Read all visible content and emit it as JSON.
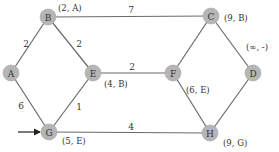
{
  "diagram": {
    "type": "weighted-graph-shortest-path",
    "start_node": "G",
    "colors": {
      "node_fill": "#b5b5b5",
      "edge": "#6a6a6a",
      "text": "#333333"
    },
    "nodes": [
      {
        "id": "A",
        "label": "A",
        "x": 11,
        "y": 73,
        "annotation": ""
      },
      {
        "id": "B",
        "label": "B",
        "x": 48,
        "y": 17,
        "annotation": "(2, A)",
        "ann_x": 58,
        "ann_y": 11
      },
      {
        "id": "C",
        "label": "C",
        "x": 211,
        "y": 16,
        "annotation": "(9, B)",
        "ann_x": 224,
        "ann_y": 21
      },
      {
        "id": "D",
        "label": "D",
        "x": 253,
        "y": 73,
        "annotation": "(∞, -)",
        "ann_x": 246,
        "ann_y": 50
      },
      {
        "id": "E",
        "label": "E",
        "x": 93,
        "y": 73,
        "annotation": "(4, B)",
        "ann_x": 104,
        "ann_y": 87
      },
      {
        "id": "F",
        "label": "F",
        "x": 173,
        "y": 73,
        "annotation": "(6, E)",
        "ann_x": 186,
        "ann_y": 93
      },
      {
        "id": "G",
        "label": "G",
        "x": 49,
        "y": 132,
        "annotation": "(5, E)",
        "ann_x": 62,
        "ann_y": 144
      },
      {
        "id": "H",
        "label": "H",
        "x": 210,
        "y": 133,
        "annotation": "(9, G)",
        "ann_x": 223,
        "ann_y": 146
      }
    ],
    "edges": [
      {
        "from": "A",
        "to": "B",
        "weight": "2",
        "lx": 26,
        "ly": 47
      },
      {
        "from": "A",
        "to": "G",
        "weight": "6",
        "lx": 21,
        "ly": 109
      },
      {
        "from": "B",
        "to": "C",
        "weight": "7",
        "lx": 131,
        "ly": 13
      },
      {
        "from": "B",
        "to": "E",
        "weight": "2",
        "lx": 79,
        "ly": 47
      },
      {
        "from": "E",
        "to": "F",
        "weight": "2",
        "lx": 132,
        "ly": 70
      },
      {
        "from": "E",
        "to": "G",
        "weight": "1",
        "lx": 79,
        "ly": 110
      },
      {
        "from": "C",
        "to": "F",
        "weight": "",
        "lx": 0,
        "ly": 0
      },
      {
        "from": "C",
        "to": "D",
        "weight": "",
        "lx": 0,
        "ly": 0
      },
      {
        "from": "F",
        "to": "H",
        "weight": "",
        "lx": 0,
        "ly": 0
      },
      {
        "from": "D",
        "to": "H",
        "weight": "",
        "lx": 0,
        "ly": 0
      },
      {
        "from": "G",
        "to": "H",
        "weight": "4",
        "lx": 131,
        "ly": 130
      }
    ],
    "start_arrow": {
      "x1": 18,
      "y1": 132,
      "x2": 40,
      "y2": 132
    }
  }
}
